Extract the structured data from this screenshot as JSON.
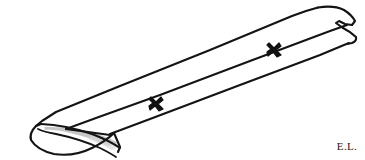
{
  "figure": {
    "style": "black ink line drawing on white background",
    "background_color": "#ffffff",
    "ink_color": "#141414",
    "shading_color": "#b8b8b8",
    "signature": "E.L.",
    "marks": [
      {
        "name": "x-mark-lower",
        "label": "X",
        "x": 156,
        "y": 103
      },
      {
        "name": "x-mark-upper",
        "label": "X",
        "x": 274,
        "y": 49
      }
    ],
    "parts": [
      {
        "name": "body",
        "label": "elongated tapered shaft"
      },
      {
        "name": "scooped-open-end",
        "label": "hollow scooped opening at lower left"
      },
      {
        "name": "rounded-tip",
        "label": "rounded stepped tip at upper right"
      },
      {
        "name": "ridge-line",
        "label": "central longitudinal ridge line"
      }
    ],
    "geometry": {
      "outline_top": "M 36,126 L 40,120 L 54,113 L 78,102 L 300,12 L 318,8 L 332,8 L 344,12 L 352,19 L 354,24",
      "outline_right_tip": "M 354,24 L 350,26 L 344,25 L 340,22 L 336,23 L 342,28 L 352,33 L 356,38 L 354,42 L 348,44",
      "ridge": "M 66,128 L 120,107 L 348,25",
      "lower_edge": "M 78,140 L 130,126 L 348,44",
      "scoop_outer": "M 36,126 Q 30,138 44,148 Q 62,158 86,150 Q 104,143 110,133",
      "scoop_inner": "M 44,128 Q 42,135 52,141 Q 70,150 92,141 Q 104,135 108,130",
      "scoop_mouth": "M 40,124 Q 70,124 96,133 Q 110,138 116,142"
    }
  }
}
